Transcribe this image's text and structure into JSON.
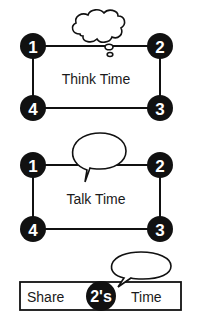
{
  "colors": {
    "ink": "#111111",
    "background": "#ffffff",
    "circle_fill": "#111111",
    "circle_text": "#ffffff"
  },
  "think_time": {
    "label": "Think Time",
    "bubble_type": "thought-bubble",
    "corners": [
      {
        "position": "top-left",
        "number": "1"
      },
      {
        "position": "top-right",
        "number": "2"
      },
      {
        "position": "bottom-right",
        "number": "3"
      },
      {
        "position": "bottom-left",
        "number": "4"
      }
    ]
  },
  "talk_time": {
    "label": "Talk Time",
    "bubble_type": "speech-bubble",
    "corners": [
      {
        "position": "top-left",
        "number": "1"
      },
      {
        "position": "top-right",
        "number": "2"
      },
      {
        "position": "bottom-right",
        "number": "3"
      },
      {
        "position": "bottom-left",
        "number": "4"
      }
    ]
  },
  "share_time": {
    "left_text": "Share",
    "badge_text": "2's",
    "right_text": "Time",
    "bubble_type": "speech-bubble"
  }
}
